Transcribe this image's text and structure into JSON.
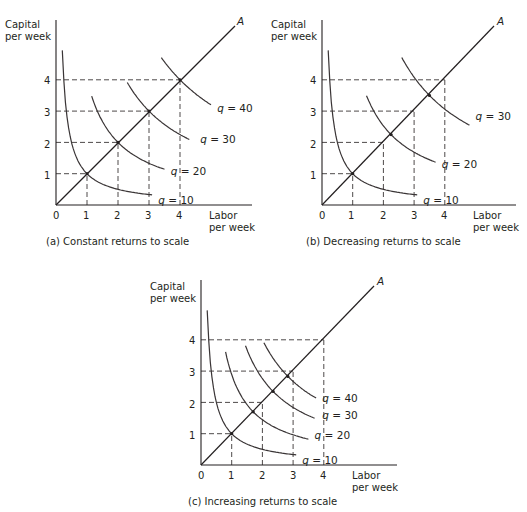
{
  "chart_data": [
    {
      "id": "a",
      "type": "line",
      "title": "(a) Constant returns to scale",
      "xlabel": "Labor per week",
      "ylabel": "Capital per week",
      "xlim": [
        0,
        5.5
      ],
      "ylim": [
        0,
        5.8
      ],
      "xticks": [
        "0",
        "1",
        "2",
        "3",
        "4"
      ],
      "yticks": [
        "1",
        "2",
        "3",
        "4"
      ],
      "ray_label": "A",
      "ray": {
        "slope": 1
      },
      "isoquants": [
        {
          "name": "q = 10",
          "q": 10,
          "k": 1,
          "x": [
            0.05,
            3.1
          ],
          "label_pos": [
            3.3,
            0.15
          ]
        },
        {
          "name": "q = 20",
          "q": 20,
          "k": 4,
          "x": [
            1.15,
            3.5
          ],
          "label_pos": [
            3.7,
            1.1
          ]
        },
        {
          "name": "q = 30",
          "q": 30,
          "k": 9,
          "x": [
            2.3,
            4.3
          ],
          "label_pos": [
            4.65,
            2.1
          ]
        },
        {
          "name": "q = 40",
          "q": 40,
          "k": 16,
          "x": [
            3.4,
            5.0
          ],
          "label_pos": [
            5.2,
            3.1
          ]
        }
      ],
      "ray_intersections": [
        [
          1,
          1
        ],
        [
          2,
          2
        ],
        [
          3,
          3
        ],
        [
          4,
          4
        ]
      ],
      "guides": [
        [
          1,
          1
        ],
        [
          2,
          2
        ],
        [
          3,
          3
        ],
        [
          4,
          4
        ]
      ]
    },
    {
      "id": "b",
      "type": "line",
      "title": "(b) Decreasing returns to scale",
      "xlabel": "Labor per week",
      "ylabel": "Capital per week",
      "xlim": [
        0,
        5.5
      ],
      "ylim": [
        0,
        5.8
      ],
      "xticks": [
        "0",
        "1",
        "2",
        "3",
        "4"
      ],
      "yticks": [
        "1",
        "2",
        "3",
        "4"
      ],
      "ray_label": "A",
      "ray": {
        "slope": 1
      },
      "isoquants": [
        {
          "name": "q = 10",
          "q": 10,
          "k": 1,
          "x": [
            0.05,
            3.1
          ],
          "label_pos": [
            3.3,
            0.15
          ]
        },
        {
          "name": "q = 20",
          "q": 20,
          "k": 5.06,
          "x": [
            1.45,
            3.7
          ],
          "label_pos": [
            3.9,
            1.3
          ]
        },
        {
          "name": "q = 30",
          "q": 30,
          "k": 12.25,
          "x": [
            2.6,
            4.8
          ],
          "label_pos": [
            5.0,
            2.85
          ]
        }
      ],
      "ray_intersections": [
        [
          1,
          1
        ],
        [
          2.25,
          2.25
        ],
        [
          3.5,
          3.5
        ]
      ],
      "guides": [
        [
          1,
          1
        ],
        [
          2,
          2
        ],
        [
          3,
          3
        ],
        [
          4,
          4
        ]
      ]
    },
    {
      "id": "c",
      "type": "line",
      "title": "(c) Increasing returns to scale",
      "xlabel": "Labor per week",
      "ylabel": "Capital per week",
      "xlim": [
        0,
        5.5
      ],
      "ylim": [
        0,
        5.8
      ],
      "xticks": [
        "0",
        "1",
        "2",
        "3",
        "4"
      ],
      "yticks": [
        "1",
        "2",
        "3",
        "4"
      ],
      "ray_label": "A",
      "ray": {
        "slope": 1
      },
      "isoquants": [
        {
          "name": "q = 10",
          "q": 10,
          "k": 1,
          "x": [
            0.05,
            3.1
          ],
          "label_pos": [
            3.3,
            0.15
          ]
        },
        {
          "name": "q = 20",
          "q": 20,
          "k": 2.89,
          "x": [
            0.8,
            3.5
          ],
          "label_pos": [
            3.7,
            0.95
          ]
        },
        {
          "name": "q = 30",
          "q": 30,
          "k": 5.52,
          "x": [
            1.45,
            3.7
          ],
          "label_pos": [
            3.95,
            1.6
          ]
        },
        {
          "name": "q = 40",
          "q": 40,
          "k": 8.01,
          "x": [
            2.05,
            3.75
          ],
          "label_pos": [
            3.95,
            2.15
          ]
        }
      ],
      "ray_intersections": [
        [
          1,
          1
        ],
        [
          1.7,
          1.7
        ],
        [
          2.35,
          2.35
        ],
        [
          2.83,
          2.83
        ]
      ],
      "guides": [
        [
          1,
          1
        ],
        [
          2,
          2
        ],
        [
          3,
          3
        ],
        [
          4,
          4
        ]
      ]
    }
  ],
  "panels": {
    "a": {
      "title": "(a) Constant returns to scale",
      "ylabel_1": "Capital",
      "ylabel_2": "per week",
      "xlabel_1": "Labor",
      "xlabel_2": "per week",
      "ray_label": "A",
      "x0": "0",
      "x1": "1",
      "x2": "2",
      "x3": "3",
      "x4": "4",
      "y1": "1",
      "y2": "2",
      "y3": "3",
      "y4": "4"
    },
    "b": {
      "title": "(b) Decreasing returns to scale",
      "ylabel_1": "Capital",
      "ylabel_2": "per week",
      "xlabel_1": "Labor",
      "xlabel_2": "per week",
      "ray_label": "A",
      "x0": "0",
      "x1": "1",
      "x2": "2",
      "x3": "3",
      "x4": "4",
      "y1": "1",
      "y2": "2",
      "y3": "3",
      "y4": "4"
    },
    "c": {
      "title": "(c) Increasing returns to scale",
      "ylabel_1": "Capital",
      "ylabel_2": "per week",
      "xlabel_1": "Labor",
      "xlabel_2": "per week",
      "ray_label": "A",
      "x0": "0",
      "x1": "1",
      "x2": "2",
      "x3": "3",
      "x4": "4",
      "y1": "1",
      "y2": "2",
      "y3": "3",
      "y4": "4"
    }
  },
  "layout": {
    "a": {
      "ox": 56,
      "oy": 205,
      "ux": 31,
      "uy": 31.3,
      "axis_top": 20,
      "axis_right": 252,
      "ray_end": [
        235,
        26
      ]
    },
    "b": {
      "ox": 322,
      "oy": 205,
      "ux": 30.7,
      "uy": 31.3,
      "axis_top": 20,
      "axis_right": 516,
      "ray_end": [
        494,
        26
      ]
    },
    "c": {
      "ox": 201,
      "oy": 465,
      "ux": 30.7,
      "uy": 31.3,
      "axis_top": 280,
      "axis_right": 397,
      "ray_end": [
        374,
        286
      ]
    }
  }
}
